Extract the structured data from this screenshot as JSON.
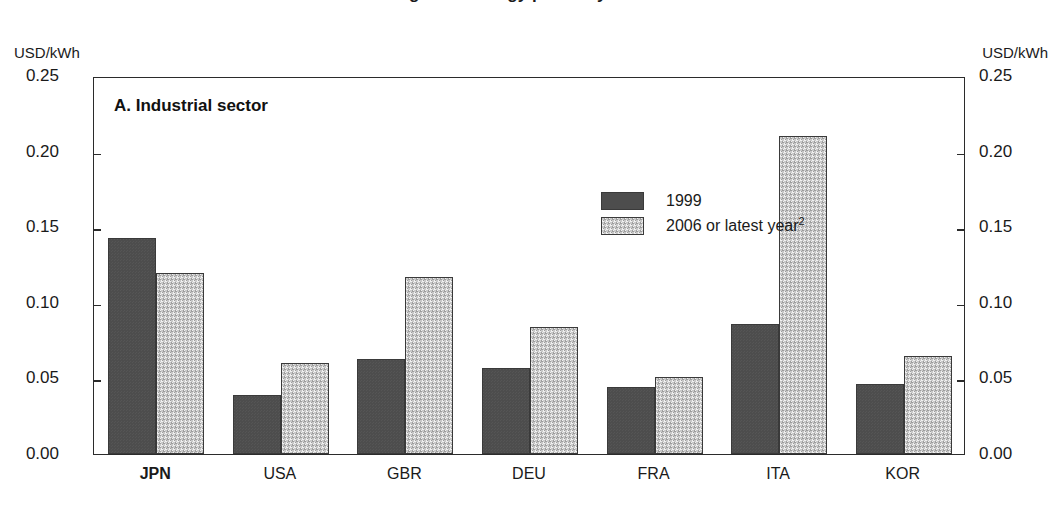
{
  "figure": {
    "clipped_top_title": "Figure 6. Energy prices by sector¹",
    "panel_label": "A. Industrial sector",
    "unit_label_left": "USD/kWh",
    "unit_label_right": "USD/kWh"
  },
  "chart_data": {
    "type": "bar",
    "title": "A. Industrial sector",
    "xlabel": "",
    "ylabel": "USD/kWh",
    "ylim": [
      0.0,
      0.25
    ],
    "yticks": [
      0.0,
      0.05,
      0.1,
      0.15,
      0.2,
      0.25
    ],
    "ytick_labels": [
      "0.00",
      "0.05",
      "0.10",
      "0.15",
      "0.20",
      "0.25"
    ],
    "grid": false,
    "legend_position": "upper-center",
    "categories": [
      "JPN",
      "USA",
      "GBR",
      "DEU",
      "FRA",
      "ITA",
      "KOR"
    ],
    "emphasized_category": "JPN",
    "series": [
      {
        "name": "1999",
        "color": "#4d4d4d",
        "values": [
          0.143,
          0.039,
          0.063,
          0.057,
          0.044,
          0.086,
          0.046
        ]
      },
      {
        "name": "2006 or latest year",
        "name_superscript": "2",
        "color": "#c9c9c9",
        "values": [
          0.12,
          0.06,
          0.117,
          0.084,
          0.051,
          0.21,
          0.065
        ]
      }
    ]
  }
}
